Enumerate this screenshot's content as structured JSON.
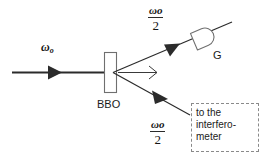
{
  "diagram": {
    "background_color": "#ffffff",
    "line_color": "#2b2b2b",
    "note_border_color": "#8a8a8a"
  },
  "labels": {
    "pump_beam": {
      "symbol": "ω",
      "subscript": "o",
      "meaning": "pump frequency omega-o"
    },
    "signal_beam": {
      "numerator_symbol": "ω",
      "numerator_subscript": "o",
      "denominator": "2",
      "meaning": "down-converted frequency omega-o over 2"
    },
    "idler_beam": {
      "numerator_symbol": "ω",
      "numerator_subscript": "o",
      "denominator": "2",
      "meaning": "down-converted frequency omega-o over 2"
    },
    "crystal": "BBO",
    "detector": "G",
    "note_lines": [
      "to the",
      "interfero-",
      "meter"
    ]
  },
  "components": {
    "crystal_name": "BBO",
    "detector_name": "G",
    "note_text": "to the interfero-meter"
  }
}
